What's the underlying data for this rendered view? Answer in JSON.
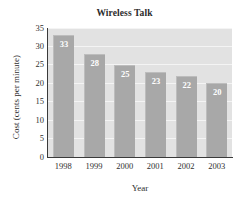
{
  "chart_data": {
    "type": "bar",
    "title": "Wireless Talk",
    "xlabel": "Year",
    "ylabel": "Cost (cents per minute)",
    "categories": [
      "1998",
      "1999",
      "2000",
      "2001",
      "2002",
      "2003"
    ],
    "values": [
      33,
      28,
      25,
      23,
      22,
      20
    ],
    "value_labels": [
      "33",
      "28",
      "25",
      "23",
      "22",
      "20"
    ],
    "ylim": [
      0,
      35
    ],
    "ytick_labels": [
      "35",
      "30",
      "25",
      "20",
      "15",
      "10",
      "5",
      "0"
    ],
    "ytick_values": [
      35,
      30,
      25,
      20,
      15,
      10,
      5,
      0
    ],
    "grid": true,
    "legend": null,
    "colors": {
      "bar_fill": "#a8a8a8",
      "bar_edge": "#bdbdbd",
      "plot_background": "#e2e2e2",
      "gridline": "#f4f4f4",
      "axis_line": "#3a3a3a",
      "value_label": "#ffffff",
      "text": "#2f2f2f",
      "title": "#2b2b2b",
      "figure_background": "#ffffff"
    }
  }
}
